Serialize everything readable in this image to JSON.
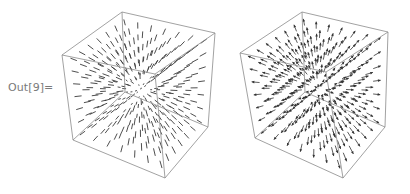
{
  "cell": {
    "output_label": "Out[9]="
  },
  "plots": [
    {
      "name": "vector-field-plot-3d-lines",
      "style": "lines",
      "offset_x": 40,
      "box_color": "#8a8a8a",
      "vector_color": "#3a3a3a",
      "corners": {
        "top_back": [
          122,
          12
        ],
        "top_right": [
          215,
          33
        ],
        "top_left": [
          62,
          55
        ],
        "top_front": [
          155,
          74
        ],
        "bottom_back": [
          125,
          92
        ],
        "bottom_right": [
          208,
          127
        ],
        "bottom_left": [
          73,
          140
        ],
        "bottom_front": [
          165,
          178
        ]
      },
      "grid_n": 7
    },
    {
      "name": "vector-field-plot-3d-arrows",
      "style": "arrows",
      "offset_x": 225,
      "box_color": "#8a8a8a",
      "vector_color": "#333333",
      "corners": {
        "top_back": [
          302,
          12
        ],
        "top_right": [
          388,
          32
        ],
        "top_left": [
          240,
          53
        ],
        "top_front": [
          326,
          72
        ],
        "bottom_back": [
          305,
          92
        ],
        "bottom_right": [
          385,
          127
        ],
        "bottom_left": [
          255,
          138
        ],
        "bottom_front": [
          343,
          178
        ]
      },
      "grid_n": 7
    }
  ]
}
